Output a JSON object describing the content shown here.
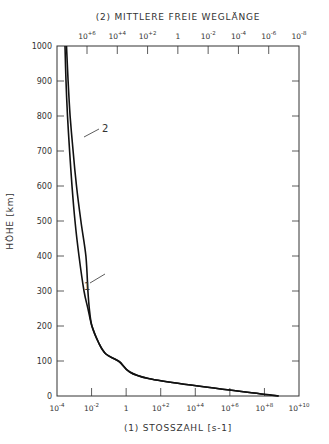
{
  "chart_data": {
    "type": "line",
    "title": "",
    "top_axis": {
      "label": "(2) MITTLERE FREIE WEGLÄNGE",
      "ticks": [
        "10^+6",
        "10^+4",
        "10^+2",
        "1",
        "10^-2",
        "10^-4",
        "10^-6",
        "10^-8"
      ],
      "tick_display": [
        "10+6",
        "10+4",
        "10+2",
        "1",
        "10-2",
        "10-4",
        "10-6",
        "10-8"
      ]
    },
    "xlabel": "(1) STOSSZAHL [s-1]",
    "x_ticks": [
      "10^-4",
      "10^-2",
      "1",
      "10^+2",
      "10^+4",
      "10^+6",
      "10^+8",
      "10^+10"
    ],
    "x_tick_display": [
      "10-4",
      "10-2",
      "1",
      "10+2",
      "10+4",
      "10+6",
      "10+8",
      "10+10"
    ],
    "xscale": "log",
    "xlim_log10": [
      -4,
      10
    ],
    "ylabel": "HÖHE [km]",
    "ylim": [
      0,
      1000
    ],
    "y_ticks": [
      0,
      100,
      200,
      300,
      400,
      500,
      600,
      700,
      800,
      900,
      1000
    ],
    "grid": false,
    "series": [
      {
        "name": "1",
        "axis": "bottom (Stosszahl, log10 s^-1)",
        "points_log10_x_vs_height_km": [
          [
            -3.54,
            1000
          ],
          [
            -3.48,
            900
          ],
          [
            -3.39,
            800
          ],
          [
            -3.27,
            700
          ],
          [
            -3.13,
            600
          ],
          [
            -2.96,
            500
          ],
          [
            -2.73,
            400
          ],
          [
            -2.44,
            300
          ],
          [
            -2.21,
            250
          ],
          [
            -1.98,
            200
          ],
          [
            -1.57,
            150
          ],
          [
            -1.17,
            120
          ],
          [
            -0.45,
            100
          ],
          [
            1.29,
            50
          ],
          [
            8.82,
            0
          ]
        ]
      },
      {
        "name": "2",
        "axis": "top (mittlere freie Weglänge, reversed)",
        "points_log10_x_vs_height_km": [
          [
            -3.45,
            1000
          ],
          [
            -3.36,
            900
          ],
          [
            -3.24,
            800
          ],
          [
            -3.07,
            700
          ],
          [
            -2.87,
            600
          ],
          [
            -2.62,
            500
          ],
          [
            -2.33,
            400
          ],
          [
            -2.21,
            300
          ],
          [
            -2.13,
            250
          ],
          [
            -1.98,
            200
          ],
          [
            -1.57,
            150
          ],
          [
            -1.17,
            120
          ],
          [
            -0.45,
            100
          ],
          [
            1.29,
            50
          ],
          [
            8.82,
            0
          ]
        ]
      }
    ],
    "annotations": [
      {
        "text": "1",
        "near_height_km": 320
      },
      {
        "text": "2",
        "near_height_km": 740
      }
    ]
  }
}
